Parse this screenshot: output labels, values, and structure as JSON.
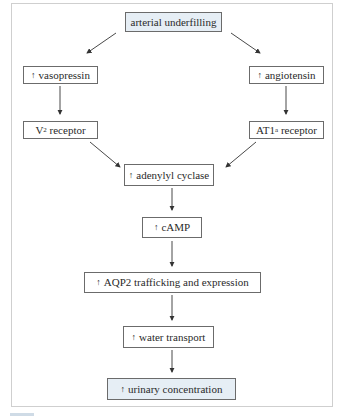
{
  "diagram": {
    "nodes": [
      {
        "id": "arterial_underfilling",
        "label": "arterial underfilling",
        "up": false,
        "highlight": true
      },
      {
        "id": "vasopressin",
        "label": "vasopressin",
        "up": true
      },
      {
        "id": "angiotensin",
        "label": "angiotensin",
        "up": true
      },
      {
        "id": "v2_receptor",
        "label": "V",
        "sub": "2",
        "suffix": " receptor",
        "up": false
      },
      {
        "id": "at1a_receptor",
        "label": "AT1",
        "sub": "a",
        "suffix": " receptor",
        "up": false
      },
      {
        "id": "adenylyl_cyclase",
        "label": "adenylyl cyclase",
        "up": true
      },
      {
        "id": "camp",
        "label": "cAMP",
        "up": true
      },
      {
        "id": "aqp2",
        "label": "AQP2 trafficking and expression",
        "up": true
      },
      {
        "id": "water_transport",
        "label": "water transport",
        "up": true
      },
      {
        "id": "urinary_concentration",
        "label": "urinary concentration",
        "up": true,
        "highlight": true
      }
    ],
    "up_arrow_glyph": "↑",
    "edges": [
      [
        "arterial_underfilling",
        "vasopressin"
      ],
      [
        "arterial_underfilling",
        "angiotensin"
      ],
      [
        "vasopressin",
        "v2_receptor"
      ],
      [
        "angiotensin",
        "at1a_receptor"
      ],
      [
        "v2_receptor",
        "adenylyl_cyclase"
      ],
      [
        "at1a_receptor",
        "adenylyl_cyclase"
      ],
      [
        "adenylyl_cyclase",
        "camp"
      ],
      [
        "camp",
        "aqp2"
      ],
      [
        "aqp2",
        "water_transport"
      ],
      [
        "water_transport",
        "urinary_concentration"
      ]
    ],
    "colors": {
      "highlight_fill": "#e6eef5",
      "border": "#6b6b6b",
      "frame": "#cfcfcf"
    }
  }
}
